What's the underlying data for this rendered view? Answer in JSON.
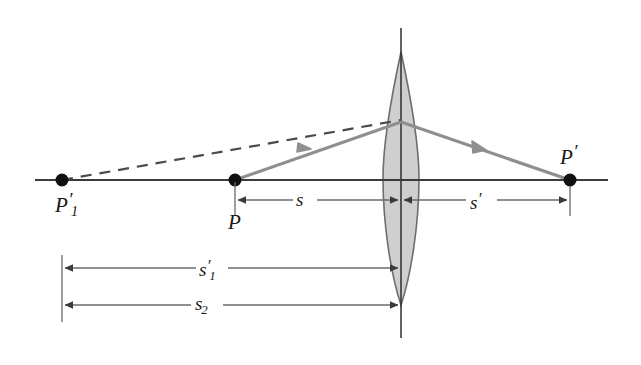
{
  "figure": {
    "type": "optics-ray-diagram",
    "background_color": "#ffffff",
    "axis_color": "#3b3b3b",
    "ray_color": "#8f8f8f",
    "lens_fill": "#cfcfcf",
    "lens_stroke": "#6e6e6e",
    "dim_color": "#6b6b6b",
    "text_color": "#1a1a1a"
  },
  "labels": {
    "virtual_object_point": {
      "base": "P",
      "subscript": "1",
      "prime": "′",
      "text": "P′₁"
    },
    "object_point": {
      "base": "P",
      "subscript": "",
      "prime": "",
      "text": "P"
    },
    "image_point": {
      "base": "P",
      "subscript": "",
      "prime": "′",
      "text": "P′"
    }
  },
  "dimensions": [
    {
      "name": "object-distance",
      "base": "s",
      "subscript": "",
      "prime": "",
      "text": "s",
      "from_x": 235,
      "to_x": 401,
      "y": 200
    },
    {
      "name": "image-distance",
      "base": "s",
      "subscript": "",
      "prime": "′",
      "text": "s′",
      "from_x": 401,
      "to_x": 570,
      "y": 200
    },
    {
      "name": "first-image-distance",
      "base": "s",
      "subscript": "1",
      "prime": "′",
      "text": "s′₁",
      "from_x": 62,
      "to_x": 401,
      "y": 268
    },
    {
      "name": "second-object-distance",
      "base": "s",
      "subscript": "2",
      "prime": "",
      "text": "s₂",
      "from_x": 62,
      "to_x": 401,
      "y": 305
    }
  ],
  "geometry": {
    "optical_axis": {
      "x1": 35,
      "x2": 608,
      "y": 180
    },
    "lens_axis": {
      "x": 401,
      "y1": 28,
      "y2": 338
    },
    "lens": {
      "center_x": 401,
      "top_y": 52,
      "bottom_y": 305,
      "half_width": 18
    },
    "points": [
      {
        "name": "P1-prime",
        "x": 62,
        "y": 180
      },
      {
        "name": "P",
        "x": 235,
        "y": 180
      },
      {
        "name": "P-prime",
        "x": 570,
        "y": 180
      }
    ],
    "rays": [
      {
        "name": "incident-ray",
        "x1": 235,
        "y1": 180,
        "x2": 401,
        "y2": 122
      },
      {
        "name": "refracted-ray",
        "x1": 401,
        "y1": 122,
        "x2": 570,
        "y2": 180
      },
      {
        "name": "virtual-ray-dashed",
        "x1": 62,
        "y1": 180,
        "x2": 401,
        "y2": 120,
        "dashed": true
      }
    ]
  }
}
